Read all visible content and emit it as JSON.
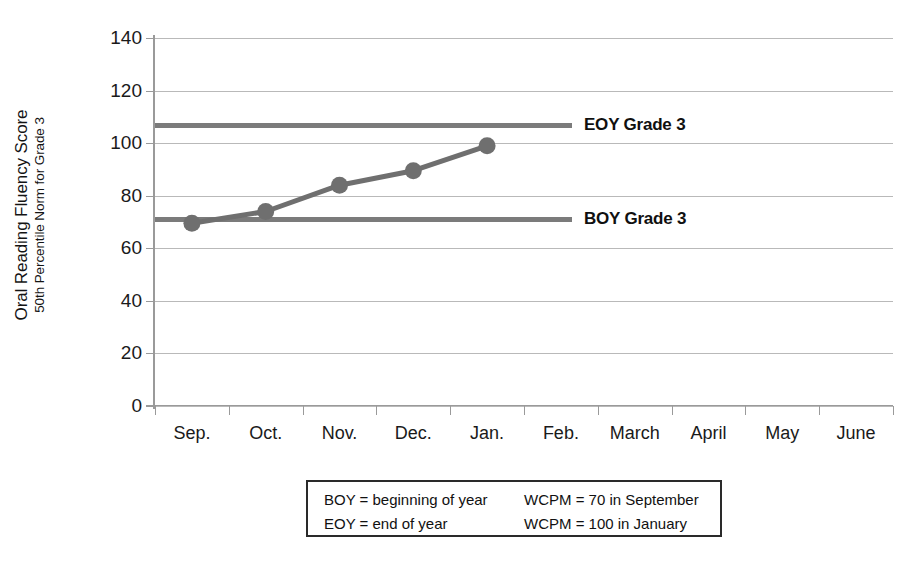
{
  "chart_data": {
    "type": "line",
    "title": "",
    "subtitle": "",
    "xlabel": "",
    "ylabel": "Oral Reading Fluency Score",
    "ylabel_secondary": "50th Percentile Norm for Grade 3",
    "ylim": [
      0,
      140
    ],
    "ytick_step": 20,
    "ytick_labels": [
      "0",
      "20",
      "40",
      "60",
      "80",
      "100",
      "120",
      "140"
    ],
    "ytick_values": [
      0,
      20,
      40,
      60,
      80,
      100,
      120,
      140
    ],
    "grid": true,
    "grid_axis": "y",
    "legend_position": "right-inline",
    "categories": [
      "Sep.",
      "Oct.",
      "Nov.",
      "Dec.",
      "Jan.",
      "Feb.",
      "March",
      "April",
      "May",
      "June"
    ],
    "series": [
      {
        "name": "Student progress",
        "color": "#6f6f6f",
        "marker": "circle",
        "values": [
          69.5,
          74,
          84,
          89.5,
          99,
          null,
          null,
          null,
          null,
          null
        ]
      }
    ],
    "reference_lines": [
      {
        "label": "EOY Grade 3",
        "value": 107,
        "color": "#7b7b7b",
        "x_end_category_index": 5.15
      },
      {
        "label": "BOY Grade 3",
        "value": 71,
        "color": "#7b7b7b",
        "x_end_category_index": 5.15
      }
    ],
    "annotations": [
      "BOY = beginning of year",
      "EOY = end of year",
      "WCPM = 70 in September",
      "WCPM = 100 in January"
    ]
  },
  "footnote_legend": {
    "rows": [
      [
        "BOY = beginning of year",
        "WCPM = 70 in September"
      ],
      [
        "EOY = end of year",
        "WCPM = 100 in January"
      ]
    ]
  },
  "colors": {
    "series": "#6f6f6f",
    "reference_line": "#7b7b7b",
    "gridline": "#b9b9b9",
    "axis": "#9a9a9a",
    "text": "#1a1a1a",
    "background": "#ffffff",
    "legend_border": "#2a2a2a"
  }
}
